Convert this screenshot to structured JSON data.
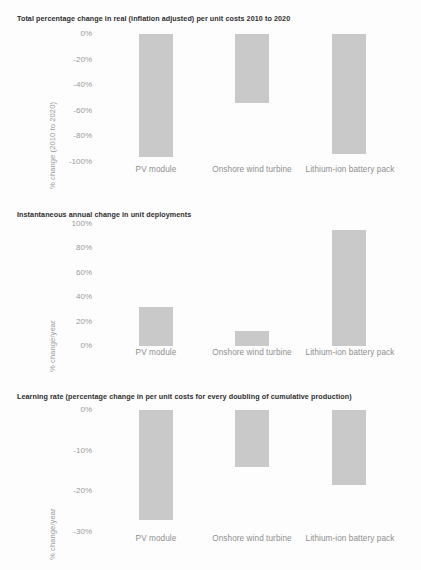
{
  "figure": {
    "background_color": "#fdfdfd",
    "bar_color": "#c9c9c9",
    "tick_color": "#9b9b9b",
    "title_color": "#2e2e2e"
  },
  "categories": [
    "PV module",
    "Onshore wind turbine",
    "Lithium-ion battery pack"
  ],
  "chart_data": [
    {
      "type": "bar",
      "title": "Total percentage change in real (inflation adjusted) per unit costs 2010 to 2020",
      "xlabel": "",
      "ylabel": "% change (2010 to 2020)",
      "categories": [
        "PV module",
        "Onshore wind turbine",
        "Lithium-ion battery pack"
      ],
      "values": [
        -96,
        -54,
        -94
      ],
      "ylim": [
        -100,
        0
      ],
      "yticks": [
        0,
        -20,
        -40,
        -60,
        -80,
        -100
      ],
      "ytick_labels": [
        "0%",
        "-20%",
        "-40%",
        "-60%",
        "-80%",
        "-100%"
      ],
      "grid": false,
      "legend": "none"
    },
    {
      "type": "bar",
      "title": "Instantaneous annual change in unit deployments",
      "xlabel": "",
      "ylabel": "% change/year",
      "categories": [
        "PV module",
        "Onshore wind turbine",
        "Lithium-ion battery pack"
      ],
      "values": [
        32,
        12,
        95
      ],
      "ylim": [
        0,
        100
      ],
      "yticks": [
        100,
        80,
        60,
        40,
        20,
        0
      ],
      "ytick_labels": [
        "100%",
        "80%",
        "60%",
        "40%",
        "20%",
        "0%"
      ],
      "grid": false,
      "legend": "none"
    },
    {
      "type": "bar",
      "title": "Learning rate (percentage change in per unit costs for every doubling of cumulative production)",
      "xlabel": "",
      "ylabel": "% change/year",
      "categories": [
        "PV module",
        "Onshore wind turbine",
        "Lithium-ion battery pack"
      ],
      "values": [
        -27,
        -14,
        -18.5
      ],
      "ylim": [
        -30,
        0
      ],
      "yticks": [
        0,
        -10,
        -20,
        -30
      ],
      "ytick_labels": [
        "0%",
        "-10%",
        "-20%",
        "-30%"
      ],
      "grid": false,
      "legend": "none"
    }
  ]
}
